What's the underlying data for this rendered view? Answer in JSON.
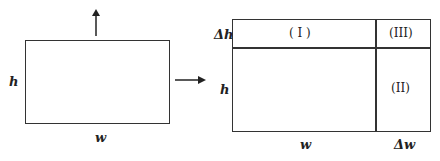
{
  "left_rect": {
    "height_label": "h",
    "width_label": "w"
  },
  "arrows": {
    "up": "arrow-up",
    "right": "arrow-right"
  },
  "right_rect": {
    "delta_h_label": "Δh",
    "height_label": "h",
    "width_label": "w",
    "delta_w_label": "Δw",
    "region_1": "( I )",
    "region_2": "(II)",
    "region_3": "(III)"
  },
  "colors": {
    "stroke": "#333333",
    "background": "#ffffff"
  }
}
